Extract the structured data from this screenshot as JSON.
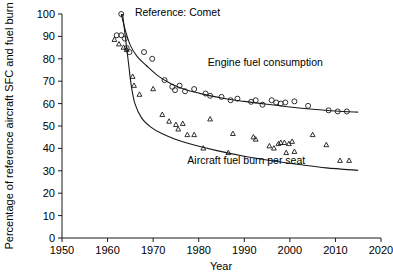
{
  "chart_data": {
    "type": "scatter",
    "title": "",
    "xlabel": "Year",
    "ylabel": "Percentage of reference aircraft SFC and fuel burn",
    "xlim": [
      1950,
      2020
    ],
    "ylim": [
      0,
      100
    ],
    "xticks": [
      1950,
      1960,
      1970,
      1980,
      1990,
      2000,
      2010,
      2020
    ],
    "yticks": [
      0,
      10,
      20,
      30,
      40,
      50,
      60,
      70,
      80,
      90,
      100
    ],
    "grid": false,
    "legend_position": "inline-annotations",
    "annotations": [
      {
        "text": "Reference: Comet",
        "x": 1966.0,
        "y": 99.0
      },
      {
        "text": "Engine fuel consumption",
        "x": 1982.0,
        "y": 77.0
      },
      {
        "text": "Aircraft fuel burn per seat",
        "x": 1977.5,
        "y": 33.0
      }
    ],
    "series": [
      {
        "name": "Engine fuel consumption",
        "marker": "circle",
        "points": [
          [
            1963.0,
            100.0
          ],
          [
            1962.0,
            90.5
          ],
          [
            1963.0,
            90.5
          ],
          [
            1963.8,
            89.0
          ],
          [
            1964.2,
            84.8
          ],
          [
            1964.8,
            83.0
          ],
          [
            1968.0,
            83.0
          ],
          [
            1969.8,
            80.0
          ],
          [
            1972.5,
            70.5
          ],
          [
            1974.2,
            67.5
          ],
          [
            1974.8,
            66.0
          ],
          [
            1975.8,
            68.0
          ],
          [
            1977.0,
            65.5
          ],
          [
            1979.0,
            66.5
          ],
          [
            1981.5,
            64.5
          ],
          [
            1982.5,
            63.5
          ],
          [
            1985.0,
            63.0
          ],
          [
            1987.0,
            61.5
          ],
          [
            1988.5,
            62.2
          ],
          [
            1991.5,
            60.8
          ],
          [
            1992.5,
            61.5
          ],
          [
            1994.0,
            59.5
          ],
          [
            1996.0,
            61.5
          ],
          [
            1997.0,
            60.5
          ],
          [
            1998.0,
            60.0
          ],
          [
            1999.0,
            60.5
          ],
          [
            2001.0,
            61.0
          ],
          [
            2004.0,
            59.0
          ],
          [
            2008.5,
            57.0
          ],
          [
            2010.5,
            56.5
          ],
          [
            2012.5,
            56.5
          ]
        ]
      },
      {
        "name": "Aircraft fuel burn per seat",
        "marker": "triangle",
        "points": [
          [
            1961.5,
            88.5
          ],
          [
            1962.5,
            86.5
          ],
          [
            1963.5,
            85.0
          ],
          [
            1964.2,
            84.0
          ],
          [
            1965.5,
            72.0
          ],
          [
            1965.8,
            68.0
          ],
          [
            1967.0,
            64.0
          ],
          [
            1970.0,
            66.5
          ],
          [
            1972.0,
            55.0
          ],
          [
            1973.5,
            52.0
          ],
          [
            1975.0,
            50.5
          ],
          [
            1975.5,
            48.5
          ],
          [
            1976.5,
            51.0
          ],
          [
            1977.5,
            46.0
          ],
          [
            1979.0,
            46.0
          ],
          [
            1981.0,
            40.0
          ],
          [
            1982.5,
            53.0
          ],
          [
            1986.5,
            38.0
          ],
          [
            1987.5,
            46.5
          ],
          [
            1992.0,
            45.0
          ],
          [
            1992.5,
            44.0
          ],
          [
            1995.5,
            41.0
          ],
          [
            1996.5,
            40.0
          ],
          [
            1997.5,
            42.0
          ],
          [
            1998.0,
            42.5
          ],
          [
            1998.8,
            42.5
          ],
          [
            1999.2,
            38.0
          ],
          [
            1999.8,
            42.0
          ],
          [
            2000.5,
            43.0
          ],
          [
            2001.0,
            38.5
          ],
          [
            2005.0,
            46.0
          ],
          [
            2008.0,
            41.5
          ],
          [
            2011.0,
            34.5
          ],
          [
            2013.0,
            34.5
          ]
        ]
      }
    ],
    "trend_curves": [
      {
        "name": "Engine fuel consumption trend",
        "points": [
          [
            1963.0,
            100.0
          ],
          [
            1964.0,
            92.0
          ],
          [
            1965.0,
            86.0
          ],
          [
            1966.5,
            81.0
          ],
          [
            1968.5,
            77.0
          ],
          [
            1971.0,
            72.5
          ],
          [
            1974.0,
            68.8
          ],
          [
            1977.0,
            66.3
          ],
          [
            1980.0,
            64.7
          ],
          [
            1985.0,
            62.5
          ],
          [
            1990.0,
            61.0
          ],
          [
            1995.0,
            59.7
          ],
          [
            2000.0,
            58.5
          ],
          [
            2005.0,
            57.5
          ],
          [
            2010.0,
            56.7
          ],
          [
            2015.0,
            56.2
          ]
        ]
      },
      {
        "name": "Aircraft fuel burn per seat trend",
        "points": [
          [
            1963.3,
            100.0
          ],
          [
            1964.0,
            88.0
          ],
          [
            1964.6,
            78.0
          ],
          [
            1965.2,
            68.0
          ],
          [
            1966.0,
            60.0
          ],
          [
            1967.5,
            53.5
          ],
          [
            1969.5,
            49.5
          ],
          [
            1972.0,
            46.5
          ],
          [
            1975.0,
            44.0
          ],
          [
            1979.0,
            41.5
          ],
          [
            1984.0,
            39.0
          ],
          [
            1990.0,
            36.5
          ],
          [
            1996.0,
            34.5
          ],
          [
            2002.0,
            32.8
          ],
          [
            2008.0,
            31.3
          ],
          [
            2015.0,
            30.2
          ]
        ]
      }
    ]
  }
}
